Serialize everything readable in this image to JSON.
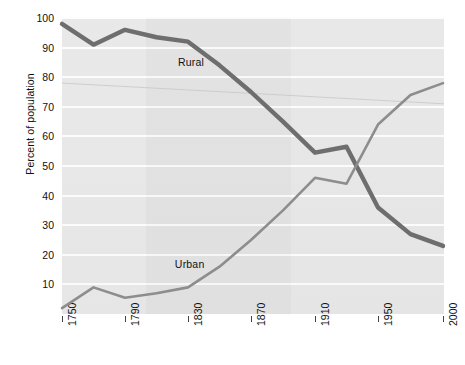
{
  "chart_data": {
    "type": "line",
    "title": "",
    "subtitle": "",
    "xlabel": "",
    "ylabel": "Percent of population",
    "xlim": [
      1750,
      2000
    ],
    "ylim": [
      0,
      100
    ],
    "grid": true,
    "legend_position": "inline-annotation",
    "x_tick_labels": [
      "1750",
      "1790",
      "1830",
      "1870",
      "1910",
      "1950",
      "2000"
    ],
    "x_ticks": [
      1750,
      1790,
      1830,
      1870,
      1910,
      1950,
      2000
    ],
    "y_tick_labels": [
      "10",
      "20",
      "30",
      "40",
      "50",
      "60",
      "70",
      "80",
      "90",
      "100"
    ],
    "y_ticks": [
      10,
      20,
      30,
      40,
      50,
      60,
      70,
      80,
      90,
      100
    ],
    "x": [
      1750,
      1770,
      1790,
      1810,
      1830,
      1850,
      1870,
      1890,
      1910,
      1930,
      1950,
      1975,
      2000
    ],
    "series": [
      {
        "name": "Rural",
        "color": "#6e6e6e",
        "width": 4.4,
        "annotation": "Rural",
        "values": [
          98.0,
          91.0,
          96.0,
          93.5,
          92.0,
          84.0,
          75.0,
          65.0,
          54.5,
          56.5,
          36.0,
          27.0,
          23.0
        ]
      },
      {
        "name": "Urban",
        "color": "#8d8d8d",
        "width": 2.6,
        "annotation": "Urban",
        "values": [
          2.0,
          9.0,
          5.5,
          7.0,
          9.0,
          16.0,
          25.0,
          35.0,
          46.0,
          44.0,
          64.0,
          74.0,
          78.0
        ]
      }
    ],
    "annotations": [
      {
        "text": "Rural",
        "x": 1830,
        "y": 85
      },
      {
        "text": "Urban",
        "x": 1828,
        "y": 17
      }
    ]
  },
  "axes": {
    "y_title": "Percent of population"
  },
  "colors": {
    "plot_background": "#e6e6e6",
    "gridline": "#fdfdfd",
    "page_background": "#ffffff",
    "rural": "#6e6e6e",
    "urban": "#8d8d8d",
    "text": "#111111"
  }
}
